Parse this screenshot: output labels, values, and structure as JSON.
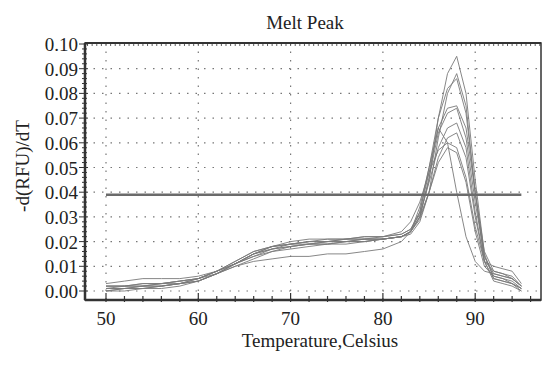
{
  "chart_data": {
    "type": "line",
    "title": "Melt Peak",
    "xlabel": "Temperature,Celsius",
    "ylabel": "-d(RFU)/dT",
    "xlim": [
      48,
      97
    ],
    "ylim": [
      -0.0035,
      0.1
    ],
    "xticks": [
      50,
      60,
      70,
      80,
      90
    ],
    "yticks": [
      0.0,
      0.01,
      0.02,
      0.03,
      0.04,
      0.05,
      0.06,
      0.07,
      0.08,
      0.09,
      0.1
    ],
    "ytick_labels": [
      "0.00",
      "0.01",
      "0.02",
      "0.03",
      "0.04",
      "0.05",
      "0.06",
      "0.07",
      "0.08",
      "0.09",
      "0.10"
    ],
    "grid": true,
    "legend": null,
    "threshold": {
      "y": 0.039,
      "x": [
        50,
        95
      ],
      "color": "#6b6b6b"
    },
    "x": [
      50,
      52,
      54,
      56,
      58,
      60,
      62,
      64,
      66,
      68,
      70,
      72,
      74,
      76,
      78,
      80,
      82,
      83,
      84,
      85,
      86,
      87,
      88,
      89,
      90,
      91,
      92,
      93,
      94,
      95
    ],
    "series": [
      {
        "name": "s1",
        "values": [
          0.001,
          0.001,
          0.002,
          0.002,
          0.003,
          0.004,
          0.007,
          0.011,
          0.015,
          0.018,
          0.019,
          0.02,
          0.02,
          0.021,
          0.021,
          0.021,
          0.022,
          0.024,
          0.03,
          0.045,
          0.07,
          0.088,
          0.095,
          0.08,
          0.045,
          0.015,
          0.005,
          0.004,
          0.003,
          0.001
        ]
      },
      {
        "name": "s2",
        "values": [
          0.0,
          0.001,
          0.001,
          0.002,
          0.003,
          0.004,
          0.007,
          0.011,
          0.015,
          0.017,
          0.019,
          0.019,
          0.02,
          0.02,
          0.021,
          0.021,
          0.022,
          0.023,
          0.028,
          0.04,
          0.062,
          0.08,
          0.088,
          0.075,
          0.04,
          0.012,
          0.004,
          0.003,
          0.002,
          0.0
        ]
      },
      {
        "name": "s3",
        "values": [
          0.002,
          0.002,
          0.003,
          0.003,
          0.004,
          0.005,
          0.008,
          0.012,
          0.016,
          0.018,
          0.019,
          0.02,
          0.021,
          0.021,
          0.022,
          0.022,
          0.023,
          0.025,
          0.032,
          0.048,
          0.066,
          0.074,
          0.075,
          0.066,
          0.04,
          0.016,
          0.008,
          0.007,
          0.006,
          0.002
        ]
      },
      {
        "name": "s4",
        "values": [
          0.001,
          0.002,
          0.002,
          0.003,
          0.003,
          0.005,
          0.008,
          0.011,
          0.014,
          0.017,
          0.018,
          0.019,
          0.019,
          0.02,
          0.02,
          0.021,
          0.022,
          0.024,
          0.03,
          0.046,
          0.064,
          0.072,
          0.074,
          0.062,
          0.036,
          0.014,
          0.007,
          0.006,
          0.005,
          0.002
        ]
      },
      {
        "name": "s5",
        "values": [
          0.0,
          0.0,
          0.001,
          0.001,
          0.002,
          0.004,
          0.007,
          0.011,
          0.015,
          0.018,
          0.02,
          0.021,
          0.021,
          0.021,
          0.022,
          0.022,
          0.023,
          0.025,
          0.031,
          0.044,
          0.058,
          0.066,
          0.068,
          0.058,
          0.032,
          0.012,
          0.005,
          0.004,
          0.003,
          0.001
        ]
      },
      {
        "name": "s6",
        "values": [
          0.003,
          0.004,
          0.005,
          0.005,
          0.005,
          0.006,
          0.008,
          0.011,
          0.014,
          0.016,
          0.018,
          0.019,
          0.02,
          0.02,
          0.021,
          0.022,
          0.024,
          0.028,
          0.036,
          0.048,
          0.057,
          0.06,
          0.058,
          0.046,
          0.026,
          0.012,
          0.01,
          0.009,
          0.008,
          0.003
        ]
      },
      {
        "name": "s7",
        "values": [
          0.001,
          0.001,
          0.002,
          0.002,
          0.003,
          0.004,
          0.007,
          0.01,
          0.013,
          0.016,
          0.017,
          0.018,
          0.019,
          0.019,
          0.02,
          0.021,
          0.022,
          0.024,
          0.03,
          0.04,
          0.052,
          0.058,
          0.056,
          0.044,
          0.024,
          0.01,
          0.006,
          0.005,
          0.004,
          0.001
        ]
      },
      {
        "name": "s8",
        "values": [
          0.002,
          0.002,
          0.003,
          0.003,
          0.004,
          0.005,
          0.007,
          0.01,
          0.012,
          0.013,
          0.014,
          0.014,
          0.015,
          0.015,
          0.016,
          0.017,
          0.02,
          0.024,
          0.034,
          0.05,
          0.066,
          0.06,
          0.04,
          0.022,
          0.012,
          0.008,
          0.007,
          0.006,
          0.005,
          0.002
        ]
      },
      {
        "name": "s9",
        "values": [
          0.0,
          0.001,
          0.001,
          0.002,
          0.003,
          0.005,
          0.008,
          0.012,
          0.016,
          0.018,
          0.019,
          0.02,
          0.02,
          0.021,
          0.021,
          0.021,
          0.022,
          0.024,
          0.032,
          0.05,
          0.07,
          0.082,
          0.086,
          0.072,
          0.04,
          0.014,
          0.006,
          0.005,
          0.003,
          0.0
        ]
      },
      {
        "name": "s10",
        "values": [
          0.002,
          0.002,
          0.002,
          0.003,
          0.004,
          0.005,
          0.008,
          0.011,
          0.015,
          0.017,
          0.018,
          0.019,
          0.019,
          0.02,
          0.02,
          0.021,
          0.022,
          0.024,
          0.029,
          0.04,
          0.054,
          0.062,
          0.064,
          0.054,
          0.03,
          0.012,
          0.008,
          0.007,
          0.005,
          0.002
        ]
      }
    ],
    "colors": {
      "axis": "#333333",
      "grid": "#777777",
      "series": "#7a7a7a",
      "threshold": "#6b6b6b"
    }
  }
}
